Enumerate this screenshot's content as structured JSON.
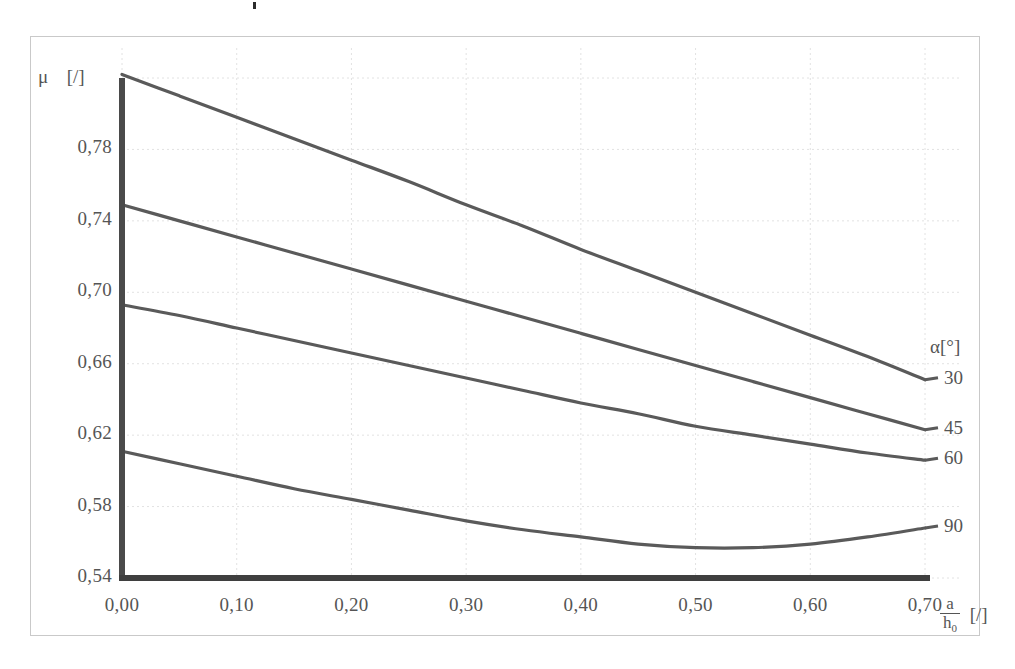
{
  "figure": {
    "background": "#ffffff",
    "line_color": "#5a5a5a",
    "axis_color": "#4a4a4a",
    "grid_color": "#e2e2e2",
    "frame_color": "#c9c9c9"
  },
  "axes": {
    "y_symbol": "μ",
    "y_unit": "[/]",
    "y_ticks": [
      "0,78",
      "0,74",
      "0,70",
      "0,66",
      "0,62",
      "0,58",
      "0,54"
    ],
    "x_ticks": [
      "0,00",
      "0,10",
      "0,20",
      "0,30",
      "0,40",
      "0,50",
      "0,60",
      "0,70"
    ],
    "x_label_numerator": "a",
    "x_label_denominator": "h",
    "x_label_denominator_sub": "0",
    "x_unit": "[/]"
  },
  "legend": {
    "title": "α[°]",
    "items": [
      {
        "label": "30"
      },
      {
        "label": "45"
      },
      {
        "label": "60"
      },
      {
        "label": "90"
      }
    ]
  },
  "chart_data": {
    "type": "line",
    "title": "",
    "subtitle": "",
    "xlabel": "a/h₀ [/]",
    "ylabel": "μ [/]",
    "xlim": [
      0.0,
      0.7
    ],
    "ylim": [
      0.54,
      0.82
    ],
    "y_ticks": [
      0.54,
      0.58,
      0.62,
      0.66,
      0.7,
      0.74,
      0.78
    ],
    "x_ticks": [
      0.0,
      0.1,
      0.2,
      0.3,
      0.4,
      0.5,
      0.6,
      0.7
    ],
    "grid": true,
    "legend_position": "right",
    "legend_title": "α[°]",
    "x": [
      0.0,
      0.05,
      0.1,
      0.15,
      0.2,
      0.25,
      0.3,
      0.35,
      0.4,
      0.45,
      0.5,
      0.55,
      0.6,
      0.65,
      0.7
    ],
    "series": [
      {
        "name": "30",
        "values": [
          0.822,
          0.81,
          0.798,
          0.786,
          0.774,
          0.762,
          0.749,
          0.737,
          0.724,
          0.712,
          0.7,
          0.688,
          0.676,
          0.664,
          0.651
        ]
      },
      {
        "name": "45",
        "values": [
          0.749,
          0.74,
          0.731,
          0.722,
          0.713,
          0.704,
          0.695,
          0.686,
          0.677,
          0.668,
          0.659,
          0.65,
          0.641,
          0.632,
          0.623
        ]
      },
      {
        "name": "60",
        "values": [
          0.693,
          0.687,
          0.68,
          0.673,
          0.666,
          0.659,
          0.652,
          0.645,
          0.638,
          0.632,
          0.625,
          0.62,
          0.615,
          0.61,
          0.606
        ]
      },
      {
        "name": "90",
        "values": [
          0.611,
          0.604,
          0.597,
          0.59,
          0.584,
          0.578,
          0.572,
          0.567,
          0.563,
          0.559,
          0.557,
          0.557,
          0.559,
          0.563,
          0.568
        ]
      }
    ]
  }
}
